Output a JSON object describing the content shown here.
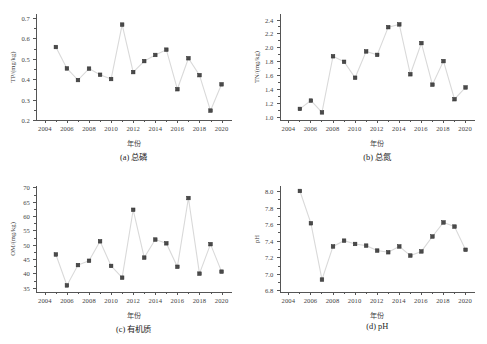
{
  "figure": {
    "xlabel": "年份",
    "x_ticks": [
      2004,
      2006,
      2008,
      2010,
      2012,
      2014,
      2016,
      2018,
      2020
    ],
    "xlim": [
      2003.2,
      2020.9
    ],
    "marker_color": "#4a4a4a",
    "line_color": "#d9d9d9"
  },
  "chart_data": [
    {
      "type": "line",
      "panel": "a",
      "caption": "(a) 总磷",
      "title": "",
      "xlabel": "年份",
      "ylabel": "TP/(mg/kg)",
      "xlim": [
        2003.2,
        2020.9
      ],
      "ylim": [
        0.2,
        0.72
      ],
      "y_ticks": [
        0.2,
        0.3,
        0.4,
        0.5,
        0.6,
        0.7
      ],
      "y_tick_labels": [
        "0.2",
        "0.3",
        "0.4",
        "0.5",
        "0.6",
        "0.7"
      ],
      "grid": false,
      "legend": "none",
      "x": [
        2005,
        2006,
        2007,
        2008,
        2009,
        2010,
        2011,
        2012,
        2013,
        2014,
        2015,
        2016,
        2017,
        2018,
        2019,
        2020
      ],
      "values": [
        0.558,
        0.453,
        0.396,
        0.452,
        0.422,
        0.401,
        0.668,
        0.435,
        0.489,
        0.519,
        0.545,
        0.351,
        0.503,
        0.42,
        0.246,
        0.375
      ]
    },
    {
      "type": "line",
      "panel": "b",
      "caption": "(b) 总氮",
      "title": "",
      "xlabel": "年份",
      "ylabel": "TN/(mg/kg)",
      "xlim": [
        2003.2,
        2020.9
      ],
      "ylim": [
        0.95,
        2.48
      ],
      "y_ticks": [
        1.0,
        1.2,
        1.4,
        1.6,
        1.8,
        2.0,
        2.2,
        2.4
      ],
      "y_tick_labels": [
        "1.0",
        "1.2",
        "1.4",
        "1.6",
        "1.8",
        "2.0",
        "2.2",
        "2.4"
      ],
      "grid": false,
      "legend": "none",
      "x": [
        2005,
        2006,
        2007,
        2008,
        2009,
        2010,
        2011,
        2012,
        2013,
        2014,
        2015,
        2016,
        2017,
        2018,
        2019,
        2020
      ],
      "values": [
        1.11,
        1.23,
        1.06,
        1.87,
        1.79,
        1.56,
        1.94,
        1.89,
        2.29,
        2.33,
        1.61,
        2.06,
        1.46,
        1.8,
        1.25,
        1.42
      ]
    },
    {
      "type": "line",
      "panel": "c",
      "caption": "(c) 有机质",
      "title": "",
      "xlabel": "年份",
      "ylabel": "OM/(mg/kg)",
      "xlim": [
        2003.2,
        2020.9
      ],
      "ylim": [
        33.5,
        70.5
      ],
      "y_ticks": [
        35,
        40,
        45,
        50,
        55,
        60,
        65,
        70
      ],
      "y_tick_labels": [
        "35",
        "40",
        "45",
        "50",
        "55",
        "60",
        "65",
        "70"
      ],
      "grid": false,
      "legend": "none",
      "x": [
        2005,
        2006,
        2007,
        2008,
        2009,
        2010,
        2011,
        2012,
        2013,
        2014,
        2015,
        2016,
        2017,
        2018,
        2019,
        2020
      ],
      "values": [
        46.6,
        35.8,
        42.9,
        44.4,
        51.2,
        42.6,
        38.5,
        62.2,
        45.5,
        51.8,
        50.5,
        42.3,
        66.3,
        39.9,
        50.2,
        40.6
      ]
    },
    {
      "type": "line",
      "panel": "d",
      "caption": "(d) pH",
      "title": "",
      "xlabel": "年份",
      "ylabel": "pH",
      "xlim": [
        2003.2,
        2020.9
      ],
      "ylim": [
        6.78,
        8.06
      ],
      "y_ticks": [
        6.8,
        7.0,
        7.2,
        7.4,
        7.6,
        7.8,
        8.0
      ],
      "y_tick_labels": [
        "6.8",
        "7.0",
        "7.2",
        "7.4",
        "7.6",
        "7.8",
        "8.0"
      ],
      "grid": false,
      "legend": "none",
      "x": [
        2005,
        2006,
        2007,
        2008,
        2009,
        2010,
        2011,
        2012,
        2013,
        2014,
        2015,
        2016,
        2017,
        2018,
        2019,
        2020
      ],
      "values": [
        8.0,
        7.61,
        6.93,
        7.33,
        7.4,
        7.36,
        7.34,
        7.28,
        7.26,
        7.33,
        7.22,
        7.27,
        7.45,
        7.62,
        7.57,
        7.29
      ]
    }
  ]
}
